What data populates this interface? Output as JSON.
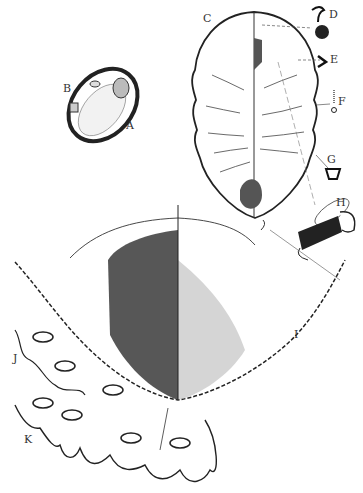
{
  "figure": {
    "labels": [
      {
        "id": "A",
        "text": "A",
        "x": 126,
        "y": 123
      },
      {
        "id": "B",
        "text": "B",
        "x": 63,
        "y": 86
      },
      {
        "id": "C",
        "text": "C",
        "x": 203,
        "y": 14
      },
      {
        "id": "D",
        "text": "D",
        "x": 329,
        "y": 10
      },
      {
        "id": "E",
        "text": "E",
        "x": 330,
        "y": 55
      },
      {
        "id": "F",
        "text": "F",
        "x": 338,
        "y": 97
      },
      {
        "id": "G",
        "text": "G",
        "x": 327,
        "y": 155
      },
      {
        "id": "H",
        "text": "H",
        "x": 336,
        "y": 198
      },
      {
        "id": "I",
        "text": "I",
        "x": 294,
        "y": 330
      },
      {
        "id": "J",
        "text": "J",
        "x": 13,
        "y": 354
      },
      {
        "id": "K",
        "text": "K",
        "x": 24,
        "y": 435
      }
    ],
    "colors": {
      "ink": "#1a1a1a",
      "paper": "#ffffff",
      "shade": "#4a4a4a"
    }
  }
}
